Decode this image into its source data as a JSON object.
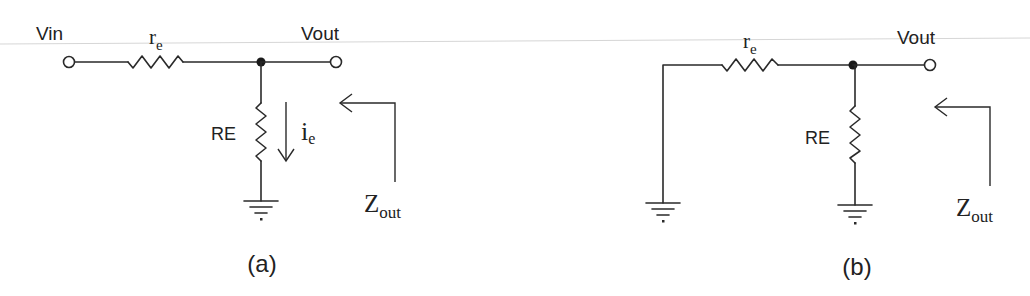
{
  "figure": {
    "panels": [
      {
        "id": "a",
        "caption": "(a)",
        "labels": {
          "vin": "Vin",
          "vout": "Vout",
          "re_small": "r",
          "re_small_sub": "e",
          "re_large": "RE",
          "current": "i",
          "current_sub": "e",
          "zout": "Z",
          "zout_sub": "out"
        },
        "components": [
          "input-terminal",
          "resistor-re-small",
          "junction-node",
          "output-terminal",
          "resistor-RE",
          "current-arrow-ie",
          "ground",
          "zout-arrow"
        ]
      },
      {
        "id": "b",
        "caption": "(b)",
        "labels": {
          "vout": "Vout",
          "re_small": "r",
          "re_small_sub": "e",
          "re_large": "RE",
          "zout": "Z",
          "zout_sub": "out"
        },
        "components": [
          "grounded-input",
          "resistor-re-small",
          "junction-node",
          "output-terminal",
          "resistor-RE",
          "ground",
          "ground",
          "zout-arrow"
        ]
      }
    ]
  }
}
